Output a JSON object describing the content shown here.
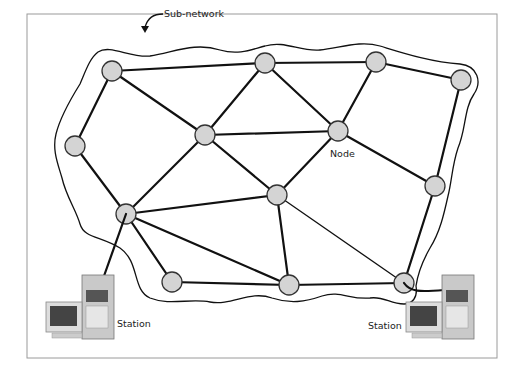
{
  "labels": {
    "subnetwork": "Sub-network",
    "node": "Node",
    "station_left": "Station",
    "station_right": "Station"
  },
  "colors": {
    "node_fill": "#d4d4d4",
    "line": "#111111",
    "frame": "#9a9a9a"
  },
  "nodes": [
    "A",
    "B",
    "C",
    "D",
    "E",
    "F",
    "G",
    "H",
    "I",
    "J",
    "K",
    "L",
    "M"
  ],
  "links": [
    [
      "A",
      "B"
    ],
    [
      "B",
      "C"
    ],
    [
      "C",
      "D"
    ],
    [
      "A",
      "E"
    ],
    [
      "A",
      "F"
    ],
    [
      "B",
      "F"
    ],
    [
      "F",
      "G"
    ],
    [
      "B",
      "G"
    ],
    [
      "C",
      "G"
    ],
    [
      "G",
      "H"
    ],
    [
      "D",
      "H"
    ],
    [
      "E",
      "I"
    ],
    [
      "F",
      "I"
    ],
    [
      "G",
      "J"
    ],
    [
      "F",
      "J"
    ],
    [
      "I",
      "J"
    ],
    [
      "I",
      "K"
    ],
    [
      "I",
      "L"
    ],
    [
      "J",
      "L"
    ],
    [
      "J",
      "M",
      "thin"
    ],
    [
      "K",
      "L"
    ],
    [
      "L",
      "M"
    ],
    [
      "H",
      "M"
    ]
  ],
  "stations": [
    {
      "id": "left",
      "attached_to": "I"
    },
    {
      "id": "right",
      "attached_to": "M"
    }
  ]
}
